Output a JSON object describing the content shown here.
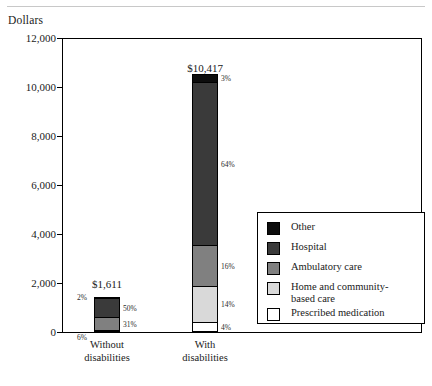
{
  "axis_title": "Dollars",
  "chart_data": {
    "type": "bar",
    "subtype": "stacked",
    "title": "",
    "xlabel": "",
    "ylabel": "Dollars",
    "ylim": [
      0,
      12000
    ],
    "yticks": [
      "0",
      "2,000",
      "4,000",
      "6,000",
      "8,000",
      "10,000",
      "12,000"
    ],
    "ytick_values": [
      0,
      2000,
      4000,
      6000,
      8000,
      10000,
      12000
    ],
    "grid": false,
    "legend_position": "right-inside",
    "categories": [
      "Without disabilities",
      "With disabilities"
    ],
    "category_lines": [
      [
        "Without",
        "disabilities"
      ],
      [
        "With",
        "disabilities"
      ]
    ],
    "totals": [
      1611,
      10417
    ],
    "total_labels": [
      "$1,611",
      "$10,417"
    ],
    "series": [
      {
        "name": "Other",
        "color": "#0d0d0d",
        "values": [
          32,
          313
        ],
        "percent_labels": [
          "2%",
          "3%"
        ]
      },
      {
        "name": "Hospital",
        "color": "#3a3a3a",
        "values": [
          806,
          6667
        ],
        "percent_labels": [
          "50%",
          "64%"
        ]
      },
      {
        "name": "Ambulatory care",
        "color": "#808080",
        "values": [
          499,
          1667
        ],
        "percent_labels": [
          "31%",
          "16%"
        ]
      },
      {
        "name": "Home and community-based care",
        "color": "#d9d9d9",
        "values": [
          0,
          1458
        ],
        "percent_labels": [
          "",
          "14%"
        ]
      },
      {
        "name": "Prescribed medication",
        "color": "#ffffff",
        "values": [
          97,
          417
        ],
        "percent_labels": [
          "6%",
          "4%"
        ]
      }
    ],
    "stack_order_top_to_bottom": [
      "Other",
      "Hospital",
      "Ambulatory care",
      "Home and community-based care",
      "Prescribed medication"
    ],
    "legend_entries": [
      {
        "label": "Other",
        "color": "#0d0d0d"
      },
      {
        "label": "Hospital",
        "color": "#3a3a3a"
      },
      {
        "label": "Ambulatory care",
        "color": "#808080"
      },
      {
        "label": "Home and community-\nbased care",
        "color": "#d9d9d9"
      },
      {
        "label": "Prescribed medication",
        "color": "#ffffff"
      }
    ]
  }
}
